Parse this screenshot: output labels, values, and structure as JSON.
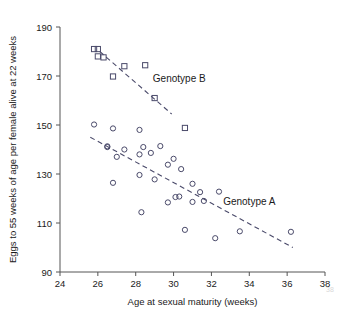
{
  "chart_data": {
    "type": "scatter",
    "title": "",
    "xlabel": "Age at sexual maturity (weeks)",
    "ylabel": "Eggs to 55 weeks of age per female alive at 22 weeks",
    "xlim": [
      24,
      38
    ],
    "ylim": [
      90,
      190
    ],
    "xticks": [
      24,
      26,
      28,
      30,
      32,
      34,
      36,
      38
    ],
    "yticks": [
      90,
      110,
      130,
      150,
      170,
      190
    ],
    "xtick_labels": [
      "24",
      "26",
      "28",
      "30",
      "32",
      "34",
      "36",
      "38"
    ],
    "ytick_labels": [
      "90",
      "110",
      "130",
      "150",
      "170",
      "190"
    ],
    "grid": false,
    "legend": "inline annotations",
    "series": [
      {
        "name": "Genotype A",
        "marker": "open-circle",
        "color": "#4a4a6a",
        "label_position": {
          "x": 34.0,
          "y": 117.5
        },
        "points": [
          [
            25.8,
            150.2
          ],
          [
            26.5,
            141.3
          ],
          [
            26.5,
            141.0
          ],
          [
            26.8,
            148.6
          ],
          [
            26.8,
            126.4
          ],
          [
            27.0,
            137.0
          ],
          [
            27.4,
            140.0
          ],
          [
            28.2,
            148.0
          ],
          [
            28.2,
            138.0
          ],
          [
            28.2,
            129.6
          ],
          [
            28.3,
            114.4
          ],
          [
            28.4,
            141.0
          ],
          [
            28.8,
            138.6
          ],
          [
            29.0,
            127.8
          ],
          [
            29.3,
            141.4
          ],
          [
            29.7,
            133.8
          ],
          [
            29.7,
            118.4
          ],
          [
            30.0,
            136.2
          ],
          [
            30.1,
            120.6
          ],
          [
            30.3,
            120.8
          ],
          [
            30.4,
            132.0
          ],
          [
            30.6,
            107.2
          ],
          [
            31.0,
            126.0
          ],
          [
            31.0,
            118.6
          ],
          [
            31.4,
            122.6
          ],
          [
            31.6,
            119.0
          ],
          [
            32.2,
            103.8
          ],
          [
            32.4,
            122.8
          ],
          [
            33.5,
            106.6
          ],
          [
            36.2,
            106.4
          ]
        ],
        "trend_line": {
          "x1": 25.6,
          "y1": 145.0,
          "x2": 36.3,
          "y2": 100.0,
          "style": "dashed"
        }
      },
      {
        "name": "Genotype B",
        "marker": "open-square",
        "color": "#4a4a6a",
        "label_position": {
          "x": 30.3,
          "y": 167.5
        },
        "points": [
          [
            25.8,
            181.0
          ],
          [
            26.0,
            181.0
          ],
          [
            26.0,
            178.0
          ],
          [
            26.3,
            177.6
          ],
          [
            26.8,
            169.8
          ],
          [
            27.4,
            174.0
          ],
          [
            28.5,
            174.4
          ],
          [
            29.0,
            161.0
          ],
          [
            30.6,
            148.8
          ]
        ],
        "trend_line": {
          "x1": 26.1,
          "y1": 180.0,
          "x2": 29.9,
          "y2": 154.5,
          "style": "dashed"
        }
      }
    ],
    "annotations": [
      {
        "text": "Genotype B",
        "x": 30.3,
        "y": 167.5
      },
      {
        "text": "Genotype A",
        "x": 34.0,
        "y": 117.5
      }
    ],
    "watermark": "38"
  }
}
